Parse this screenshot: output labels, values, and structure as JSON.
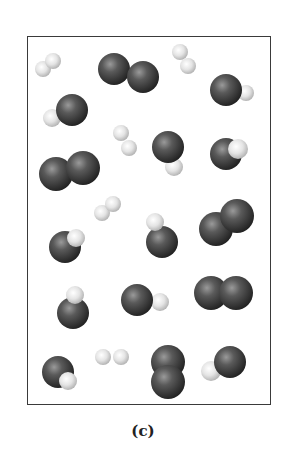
{
  "figure": {
    "caption": "(c)",
    "colors": {
      "dark_atom": "#3c3c3c",
      "light_atom": "#e6e6e6",
      "border": "#3a3a3a"
    }
  },
  "molecules": [
    {
      "type": "light-light",
      "atoms": [
        [
          43,
          69,
          8,
          "l"
        ],
        [
          53,
          61,
          8,
          "l"
        ]
      ]
    },
    {
      "type": "dark-dark",
      "atoms": [
        [
          114,
          69,
          16,
          "d"
        ],
        [
          143,
          77,
          16,
          "d"
        ]
      ]
    },
    {
      "type": "light-light",
      "atoms": [
        [
          180,
          52,
          8,
          "l"
        ],
        [
          188,
          66,
          8,
          "l"
        ]
      ]
    },
    {
      "type": "dark-light",
      "atoms": [
        [
          246,
          93,
          8,
          "l"
        ],
        [
          226,
          90,
          16,
          "d"
        ]
      ]
    },
    {
      "type": "dark-light",
      "atoms": [
        [
          52,
          118,
          9,
          "l"
        ],
        [
          72,
          110,
          16,
          "d"
        ]
      ]
    },
    {
      "type": "light-light",
      "atoms": [
        [
          121,
          133,
          8,
          "l"
        ],
        [
          129,
          148,
          8,
          "l"
        ]
      ]
    },
    {
      "type": "dark-light",
      "atoms": [
        [
          174,
          167,
          9,
          "l"
        ],
        [
          168,
          147,
          16,
          "d"
        ]
      ]
    },
    {
      "type": "dark-light",
      "atoms": [
        [
          226,
          154,
          16,
          "d"
        ],
        [
          238,
          149,
          10,
          "l"
        ]
      ]
    },
    {
      "type": "dark-dark",
      "atoms": [
        [
          56,
          174,
          17,
          "d"
        ],
        [
          83,
          168,
          17,
          "d"
        ]
      ]
    },
    {
      "type": "light-light",
      "atoms": [
        [
          102,
          213,
          8,
          "l"
        ],
        [
          113,
          204,
          8,
          "l"
        ]
      ]
    },
    {
      "type": "dark-light",
      "atoms": [
        [
          162,
          242,
          16,
          "d"
        ],
        [
          155,
          222,
          9,
          "l"
        ]
      ]
    },
    {
      "type": "dark-dark",
      "atoms": [
        [
          216,
          229,
          17,
          "d"
        ],
        [
          237,
          216,
          17,
          "d"
        ]
      ]
    },
    {
      "type": "dark-light",
      "atoms": [
        [
          65,
          247,
          16,
          "d"
        ],
        [
          76,
          238,
          9,
          "l"
        ]
      ]
    },
    {
      "type": "dark-light",
      "atoms": [
        [
          73,
          313,
          16,
          "d"
        ],
        [
          75,
          295,
          9,
          "l"
        ]
      ]
    },
    {
      "type": "light-dark",
      "atoms": [
        [
          160,
          302,
          9,
          "l"
        ],
        [
          137,
          300,
          16,
          "d"
        ]
      ]
    },
    {
      "type": "dark-dark",
      "atoms": [
        [
          211,
          293,
          17,
          "d"
        ],
        [
          236,
          293,
          17,
          "d"
        ]
      ]
    },
    {
      "type": "dark-light",
      "atoms": [
        [
          58,
          372,
          16,
          "d"
        ],
        [
          68,
          381,
          9,
          "l"
        ]
      ]
    },
    {
      "type": "light-light",
      "atoms": [
        [
          103,
          357,
          8,
          "l"
        ],
        [
          121,
          357,
          8,
          "l"
        ]
      ]
    },
    {
      "type": "dark-dark",
      "atoms": [
        [
          168,
          362,
          17,
          "d"
        ],
        [
          168,
          382,
          17,
          "d"
        ]
      ]
    },
    {
      "type": "light-dark",
      "atoms": [
        [
          211,
          371,
          10,
          "l"
        ],
        [
          230,
          362,
          16,
          "d"
        ]
      ]
    }
  ]
}
